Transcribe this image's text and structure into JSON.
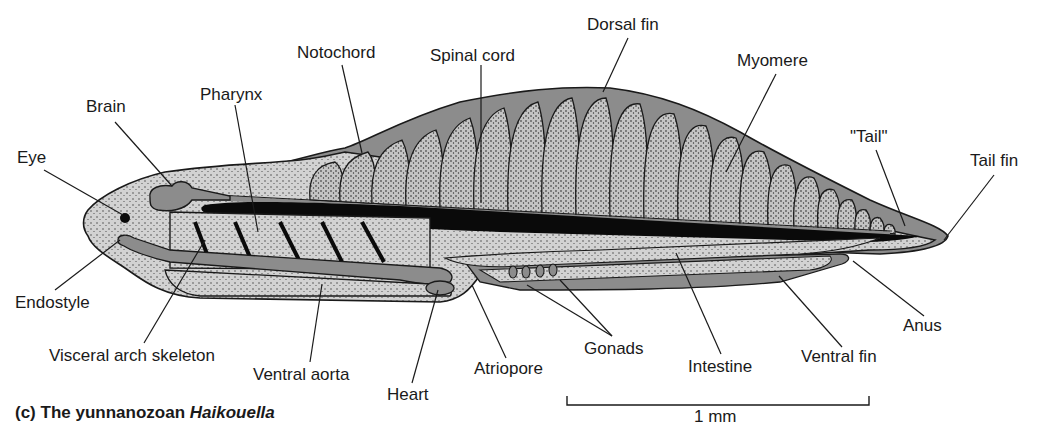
{
  "figure": {
    "caption_prefix": "(c)",
    "caption_text": "The yunnanozoan",
    "caption_genus": "Haikouella",
    "scale_bar_label": "1 mm"
  },
  "labels": {
    "eye": "Eye",
    "brain": "Brain",
    "pharynx": "Pharynx",
    "notochord": "Notochord",
    "spinal_cord": "Spinal cord",
    "dorsal_fin": "Dorsal fin",
    "myomere": "Myomere",
    "tail": "\"Tail\"",
    "tail_fin": "Tail fin",
    "endostyle": "Endostyle",
    "visceral_arch_skeleton": "Visceral arch skeleton",
    "ventral_aorta": "Ventral aorta",
    "heart": "Heart",
    "atriopore": "Atriopore",
    "gonads": "Gonads",
    "intestine": "Intestine",
    "ventral_fin": "Ventral fin",
    "anus": "Anus"
  },
  "colors": {
    "fin_gray": "#8c8c8c",
    "body_light": "#d4d4d4",
    "myomere_fill": "#c8c8c8",
    "notochord_black": "#0a0a0a",
    "outline": "#1a1a1a"
  }
}
